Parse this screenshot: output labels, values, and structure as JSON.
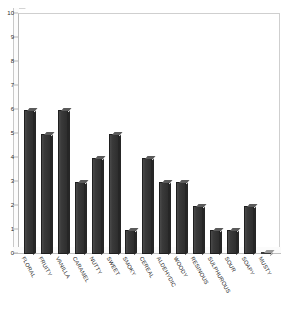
{
  "chart_data": {
    "type": "bar",
    "title": "",
    "subtitle": "",
    "xlabel": "",
    "ylabel": "",
    "ylim": [
      0,
      10
    ],
    "yticks": [
      0,
      1,
      2,
      3,
      4,
      5,
      6,
      7,
      8,
      9,
      10
    ],
    "grid": false,
    "legend": "none",
    "orientation": "vertical",
    "style": "3d-column",
    "bar_color": "#3b3b3b",
    "categories": [
      "FLORAL",
      "FRUITY",
      "VANILLA",
      "CARAMEL",
      "NUTTY",
      "SWEET",
      "SMOKY",
      "CEREAL",
      "ALDEHYDIC",
      "WOODY",
      "RESINOUS",
      "SULPHUROUS",
      "SOUR",
      "SOAPY",
      "MUSTY"
    ],
    "values": [
      6,
      5,
      6,
      3,
      4,
      5,
      1,
      4,
      3,
      3,
      2,
      1,
      1,
      2,
      0
    ]
  }
}
